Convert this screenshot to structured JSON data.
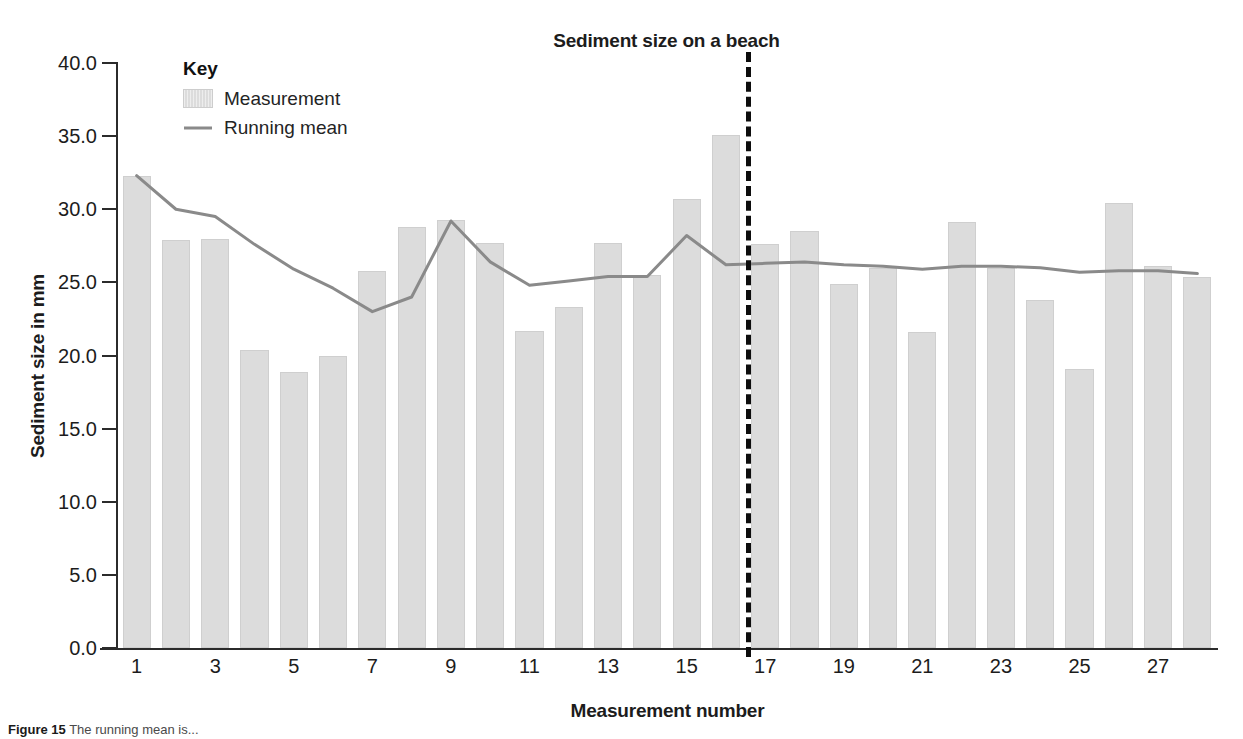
{
  "chart_data": {
    "type": "bar",
    "title": "Sediment size on a beach",
    "xlabel": "Measurement number",
    "ylabel": "Sediment size in mm",
    "grid": false,
    "legend_position": "top-left-inside",
    "legend_title": "Key",
    "ylim": [
      0.0,
      40.0
    ],
    "ytick_labels": [
      "0.0",
      "5.0",
      "10.0",
      "15.0",
      "20.0",
      "25.0",
      "30.0",
      "35.0",
      "40.0"
    ],
    "ytick_values": [
      0.0,
      5.0,
      10.0,
      15.0,
      20.0,
      25.0,
      30.0,
      35.0,
      40.0
    ],
    "xtick_labels": [
      "1",
      "3",
      "5",
      "7",
      "9",
      "11",
      "13",
      "15",
      "17",
      "19",
      "21",
      "23",
      "25",
      "27"
    ],
    "xtick_values": [
      1,
      3,
      5,
      7,
      9,
      11,
      13,
      15,
      17,
      19,
      21,
      23,
      25,
      27
    ],
    "categories": [
      1,
      2,
      3,
      4,
      5,
      6,
      7,
      8,
      9,
      10,
      11,
      12,
      13,
      14,
      15,
      16,
      17,
      18,
      19,
      20,
      21,
      22,
      23,
      24,
      25,
      26,
      27,
      28
    ],
    "series": [
      {
        "name": "Measurement",
        "type": "bar",
        "color": "#dcdcdc",
        "values": [
          32.3,
          27.9,
          28.0,
          20.4,
          18.9,
          20.0,
          25.8,
          28.8,
          29.3,
          27.7,
          21.7,
          23.3,
          27.7,
          25.5,
          30.7,
          35.1,
          27.6,
          28.5,
          24.9,
          26.0,
          21.6,
          29.1,
          26.0,
          23.8,
          19.1,
          30.4,
          26.1,
          25.4
        ]
      },
      {
        "name": "Running mean",
        "type": "line",
        "color": "#8a8a8a",
        "values": [
          32.3,
          30.0,
          29.5,
          27.6,
          25.9,
          24.6,
          23.0,
          24.0,
          29.2,
          26.4,
          24.8,
          25.1,
          25.4,
          25.4,
          28.2,
          26.2,
          26.3,
          26.4,
          26.2,
          26.1,
          25.9,
          26.1,
          26.1,
          26.0,
          25.7,
          25.8,
          25.8,
          25.6
        ]
      }
    ],
    "annotations": [
      {
        "name": "divider",
        "type": "vertical-dashed-line",
        "at_x": 16.5,
        "color": "#0d0d0d"
      }
    ]
  },
  "caption": {
    "prefix": "Figure 15",
    "text": " The running mean is..."
  }
}
